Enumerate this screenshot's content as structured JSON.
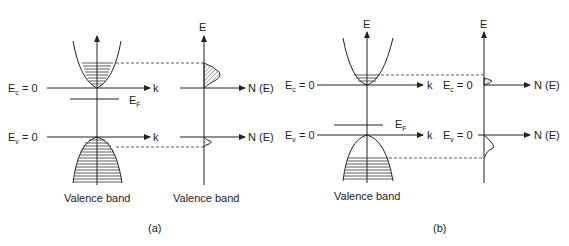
{
  "figure": {
    "panels": [
      {
        "id": "a",
        "caption": "(a)",
        "ek_diagram": {
          "energy_axis_label": "",
          "k_label": "k",
          "conduction_level_label": "E",
          "conduction_level_sub": "c",
          "conduction_level_value": " = 0",
          "valence_level_label": "E",
          "valence_level_sub": "v",
          "valence_level_value": " = 0",
          "fermi_label": "E",
          "fermi_sub": "F",
          "band_label": "Valence band"
        },
        "dos_diagram": {
          "energy_axis_label": "E",
          "x_axis_label_top": "N (E)",
          "x_axis_label_bottom": "N (E)",
          "band_label": "Valence band"
        }
      },
      {
        "id": "b",
        "caption": "(b)",
        "ek_diagram": {
          "energy_axis_label": "E",
          "k_label": "k",
          "conduction_level_label": "E",
          "conduction_level_sub": "c",
          "conduction_level_value": " = 0",
          "valence_level_label": "E",
          "valence_level_sub": "v",
          "valence_level_value": " = 0",
          "fermi_label": "E",
          "fermi_sub": "F",
          "band_label": "Valence band"
        },
        "dos_diagram": {
          "energy_axis_label": "E",
          "conduction_level_label": "E",
          "conduction_level_sub": "c",
          "conduction_level_value": " = 0",
          "valence_level_label": "E",
          "valence_level_sub": "v",
          "valence_level_value": " = 0",
          "x_axis_label_top": "N (E)",
          "x_axis_label_bottom": "N (E)"
        }
      }
    ],
    "colors": {
      "line": "#222222",
      "background": "#ffffff"
    }
  }
}
